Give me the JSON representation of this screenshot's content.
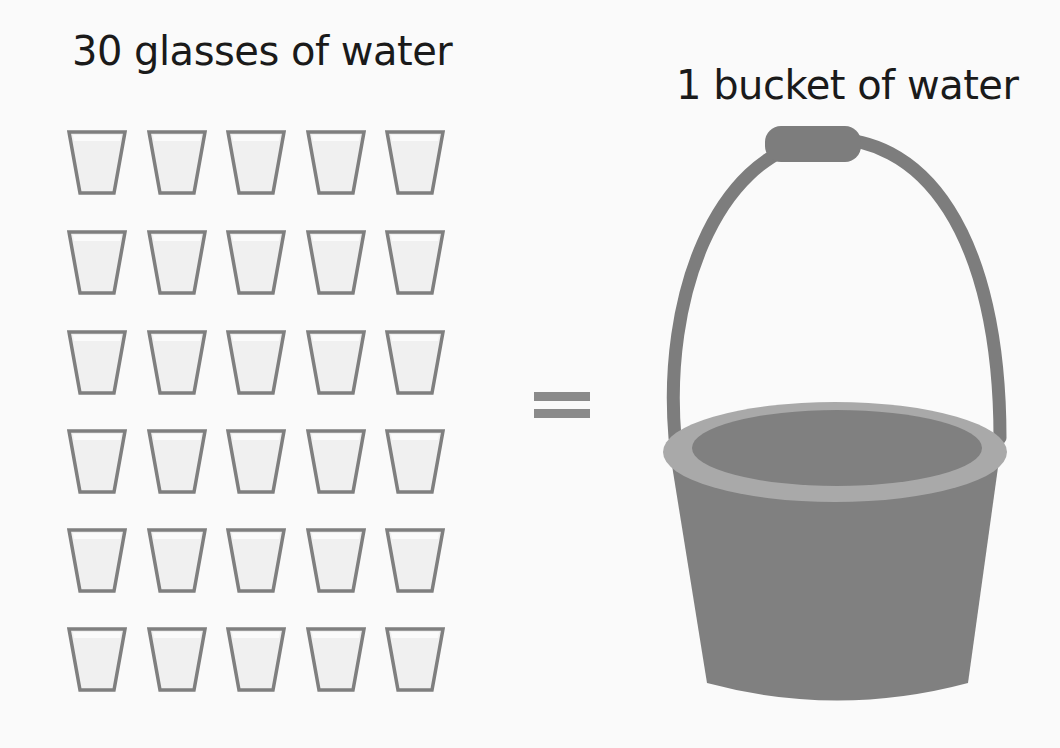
{
  "left": {
    "title": "30 glasses of water",
    "glass_count": 30,
    "rows": 6,
    "columns": 5,
    "glass_icon": "glass-icon",
    "glass_stroke_color": "#7f7f7f",
    "glass_fill_color": "#f0f0f0"
  },
  "center": {
    "symbol": "=",
    "symbol_icon": "equals-icon",
    "color": "#8a8a8a"
  },
  "right": {
    "title": "1 bucket of water",
    "bucket_count": 1,
    "bucket_icon": "bucket-icon",
    "bucket_body_color": "#808080",
    "bucket_rim_color": "#a9a9a9",
    "bucket_handle_color": "#7d7d7d"
  },
  "colors": {
    "background": "#fafafa",
    "text": "#1a1a1a"
  }
}
